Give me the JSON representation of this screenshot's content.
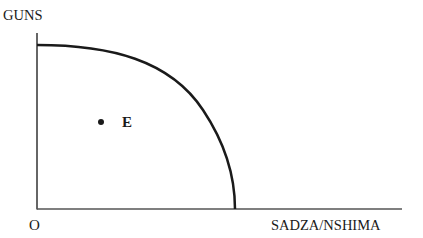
{
  "diagram": {
    "type": "production-possibilities-frontier",
    "y_axis_label": "GUNS",
    "x_axis_label": "SADZA/NSHIMA",
    "origin_label": "O",
    "point": {
      "label": "E",
      "position": "inside frontier"
    },
    "colors": {
      "line": "#1a1a1a",
      "axis": "#555555",
      "background": "#ffffff"
    }
  }
}
